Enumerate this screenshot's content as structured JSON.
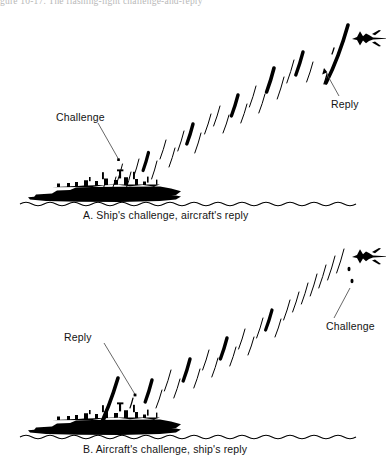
{
  "figure": {
    "top_caption_partial": "gure 10-17.  The flashing-light challenge-and-reply",
    "panels": [
      {
        "id": "A",
        "caption": "A. Ship's challenge, aircraft's reply",
        "labels": [
          {
            "id": "a-challenge",
            "text": "Challenge"
          },
          {
            "id": "a-reply",
            "text": "Reply"
          }
        ],
        "actors": [
          {
            "name": "warship-silhouette",
            "side": "left"
          },
          {
            "name": "jet-aircraft-silhouette",
            "side": "right"
          }
        ],
        "signal_origin": "ship",
        "signal_reply_origin": "aircraft"
      },
      {
        "id": "B",
        "caption": "B. Aircraft's challenge, ship's reply",
        "labels": [
          {
            "id": "b-reply",
            "text": "Reply"
          },
          {
            "id": "b-challenge",
            "text": "Challenge"
          }
        ],
        "actors": [
          {
            "name": "warship-silhouette",
            "side": "left"
          },
          {
            "name": "jet-aircraft-silhouette",
            "side": "right"
          }
        ],
        "signal_origin": "aircraft",
        "signal_reply_origin": "ship"
      }
    ],
    "colors": {
      "ink": "#000000",
      "paper": "#ffffff",
      "leader_line": "#4a4a4a",
      "faded_header": "#8e8e8e"
    }
  }
}
